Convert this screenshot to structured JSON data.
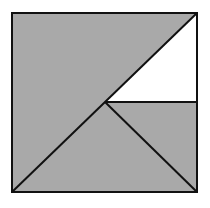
{
  "diagram": {
    "type": "geometric-square-dissection",
    "colors": {
      "fill_shaded": "#a9a9a9",
      "fill_unshaded": "#ffffff",
      "stroke": "#111111",
      "background": "#ffffff"
    },
    "square": {
      "x1": 12,
      "y1": 13,
      "x2": 197,
      "y2": 192
    },
    "points": {
      "top_left": [
        12,
        13
      ],
      "top_right": [
        197,
        13
      ],
      "bottom_left": [
        12,
        192
      ],
      "bottom_right": [
        197,
        192
      ],
      "center": [
        105,
        102
      ],
      "right_mid": [
        197,
        102
      ]
    },
    "regions": [
      {
        "name": "upper-left-triangle",
        "shaded": true
      },
      {
        "name": "upper-right-white-triangle",
        "shaded": false
      },
      {
        "name": "right-middle-triangle",
        "shaded": true
      },
      {
        "name": "bottom-triangle",
        "shaded": true
      }
    ]
  }
}
